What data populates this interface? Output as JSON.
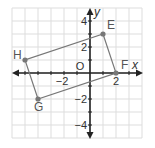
{
  "figure": {
    "grid": {
      "x_min": -6,
      "x_max": 4,
      "y_min": -5,
      "y_max": 5,
      "cell_px": 13,
      "origin_px": [
        90,
        73
      ],
      "grid_color": "#dddddd",
      "axis_color": "#222222"
    },
    "axes": {
      "x_label": "x",
      "y_label": "y",
      "origin_label": "O",
      "x_ticks": [
        {
          "value": -2,
          "label": "−2"
        },
        {
          "value": 2,
          "label": "2"
        }
      ],
      "y_ticks": [
        {
          "value": 4,
          "label": "4"
        },
        {
          "value": 2,
          "label": "2"
        },
        {
          "value": -2,
          "label": "−2"
        },
        {
          "value": -4,
          "label": "−4"
        }
      ]
    },
    "shape": {
      "stroke_color": "#777777",
      "point_color": "#777777",
      "vertices": [
        {
          "name": "E",
          "x": 1,
          "y": 3
        },
        {
          "name": "F",
          "x": 2,
          "y": 0
        },
        {
          "name": "G",
          "x": -4,
          "y": -2
        },
        {
          "name": "H",
          "x": -5,
          "y": 1
        }
      ]
    }
  }
}
